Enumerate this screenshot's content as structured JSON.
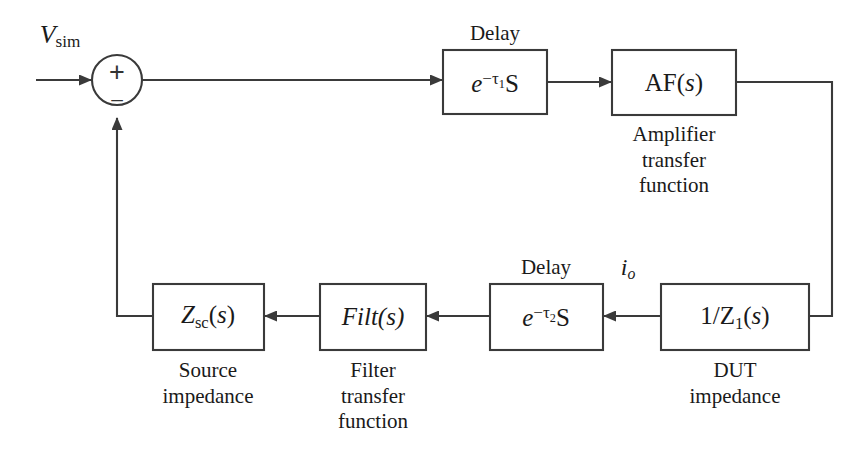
{
  "diagram": {
    "background_color": "#ffffff",
    "line_color": "#3a3a3a",
    "text_color": "#1a1a1a",
    "input_signal": {
      "base": "V",
      "subscript": "sim"
    },
    "summing_junction": {
      "name": "summing-junction",
      "plus_sign": "+",
      "minus_sign": "–"
    },
    "blocks": [
      {
        "id": "delay1",
        "text_parts": {
          "base": "e",
          "exponent_minus": "−",
          "exponent_tau": "τ",
          "exponent_index": "1",
          "exponent_s": "S"
        },
        "display_text": "e−τ1S",
        "label_above": "Delay",
        "caption_below": ""
      },
      {
        "id": "amplifier",
        "display_text": "AF(s)",
        "label_above": "",
        "caption_below": "Amplifier\ntransfer\nfunction",
        "caption_lines": [
          "Amplifier",
          "transfer",
          "function"
        ]
      },
      {
        "id": "dut",
        "display_text": "1/Z1(s)",
        "label_above": "",
        "caption_below": "DUT\nimpedance",
        "caption_lines": [
          "DUT",
          "impedance"
        ]
      },
      {
        "id": "delay2",
        "display_text": "e−τ2S",
        "label_above": "Delay",
        "caption_below": ""
      },
      {
        "id": "filter",
        "display_text": "Filt(s)",
        "label_above": "",
        "caption_below": "Filter\ntransfer\nfunction",
        "caption_lines": [
          "Filter",
          "transfer",
          "function"
        ]
      },
      {
        "id": "source_impedance",
        "display_text": "Zsc(s)",
        "label_above": "",
        "caption_below": "Source\nimpedance",
        "caption_lines": [
          "Source",
          "impedance"
        ]
      }
    ],
    "signals": [
      {
        "id": "v_sim",
        "base": "V",
        "subscript": "sim"
      },
      {
        "id": "i_o",
        "base": "i",
        "subscript": "o"
      }
    ],
    "labels": {
      "delay1_above": "Delay",
      "delay2_above": "Delay",
      "amplifier_caption_1": "Amplifier",
      "amplifier_caption_2": "transfer",
      "amplifier_caption_3": "function",
      "dut_caption_1": "DUT",
      "dut_caption_2": "impedance",
      "filter_caption_1": "Filter",
      "filter_caption_2": "transfer",
      "filter_caption_3": "function",
      "source_caption_1": "Source",
      "source_caption_2": "impedance"
    },
    "math": {
      "e_base": "e",
      "minus": "−",
      "tau": "τ",
      "tau1_index": "1",
      "tau2_index": "2",
      "cap_s": "S",
      "af": "AF(",
      "af_arg": "s",
      "af_close": ")",
      "one_over_z": "1/Z",
      "z_index": "1",
      "z_open": "(",
      "z_arg": "s",
      "z_close": ")",
      "filt": "Filt",
      "filt_open": "(",
      "filt_arg": "s",
      "filt_close": ")",
      "zsc_base": "Z",
      "zsc_sub": "sc",
      "zsc_open": "(",
      "zsc_arg": "s",
      "zsc_close": ")",
      "v_base": "V",
      "v_sub": "sim",
      "i_base": "i",
      "i_sub": "o"
    }
  }
}
